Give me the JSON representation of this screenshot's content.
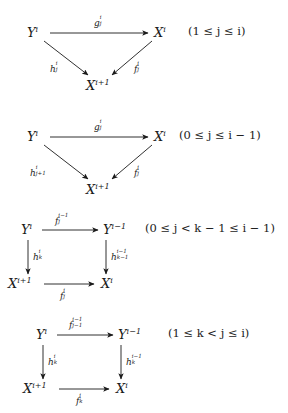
{
  "page": {
    "kind": "commutative-diagrams",
    "background": "#ffffff",
    "ink": "#1a1a1a",
    "count": 4
  },
  "diagrams": [
    {
      "id": "diagram-1",
      "shape": "triangle",
      "nodes": {
        "source": "Y",
        "source_sup": "i",
        "target": "X",
        "target_sup": "i",
        "apex": "X",
        "apex_sup": "i+1"
      },
      "labels": {
        "top": "g",
        "top_sub": "j",
        "top_sup": "i",
        "left": "h",
        "left_sub": "j",
        "left_sup": "i",
        "right": "f",
        "right_sub": "j",
        "right_sup": "i"
      },
      "condition": {
        "open": "(1 ",
        "rel1": "≤",
        "var1": "j",
        "rel2": "≤",
        "var2": "i",
        "close": ")",
        "full": "(1 ≤ j ≤ i)"
      }
    },
    {
      "id": "diagram-2",
      "shape": "triangle",
      "nodes": {
        "source": "Y",
        "source_sup": "i",
        "target": "X",
        "target_sup": "i",
        "apex": "X",
        "apex_sup": "i+1"
      },
      "labels": {
        "top": "g",
        "top_sub": "j",
        "top_sup": "i",
        "left": "h",
        "left_sub": "j+1",
        "left_sup": "i",
        "right": "f",
        "right_sub": "j",
        "right_sup": "i"
      },
      "condition": {
        "open": "(0 ",
        "rel1": "≤",
        "var1": "j",
        "rel2": "≤",
        "var2": "i",
        "tail": " − 1)",
        "full": "(0 ≤ j ≤ i − 1)"
      }
    },
    {
      "id": "diagram-3",
      "shape": "square",
      "nodes": {
        "top_left": "Y",
        "top_left_sup": "i",
        "top_right": "Y",
        "top_right_sup": "i−1",
        "bottom_left": "X",
        "bottom_left_sup": "i+1",
        "bottom_right": "X",
        "bottom_right_sup": "i"
      },
      "labels": {
        "top": "f",
        "top_sub": "j",
        "top_sup": "i−1",
        "left": "h",
        "left_sub": "k",
        "left_sup": "i",
        "right": "h",
        "right_sub": "k−1",
        "right_sup": "i−1",
        "bottom": "f",
        "bottom_sub": "j",
        "bottom_sup": "i"
      },
      "condition": {
        "full": "(0 ≤ j < k − 1 ≤ i − 1)"
      }
    },
    {
      "id": "diagram-4",
      "shape": "square",
      "nodes": {
        "top_left": "Y",
        "top_left_sup": "i",
        "top_right": "Y",
        "top_right_sup": "i−1",
        "bottom_left": "X",
        "bottom_left_sup": "i+1",
        "bottom_right": "X",
        "bottom_right_sup": "i"
      },
      "labels": {
        "top": "f",
        "top_sub": "j−1",
        "top_sup": "i−1",
        "left": "h",
        "left_sub": "k",
        "left_sup": "i",
        "right": "h",
        "right_sub": "k",
        "right_sup": "i−1",
        "bottom": "f",
        "bottom_sub": "k",
        "bottom_sup": "i"
      },
      "condition": {
        "full": "(1 ≤ k < j ≤ i)"
      }
    }
  ]
}
